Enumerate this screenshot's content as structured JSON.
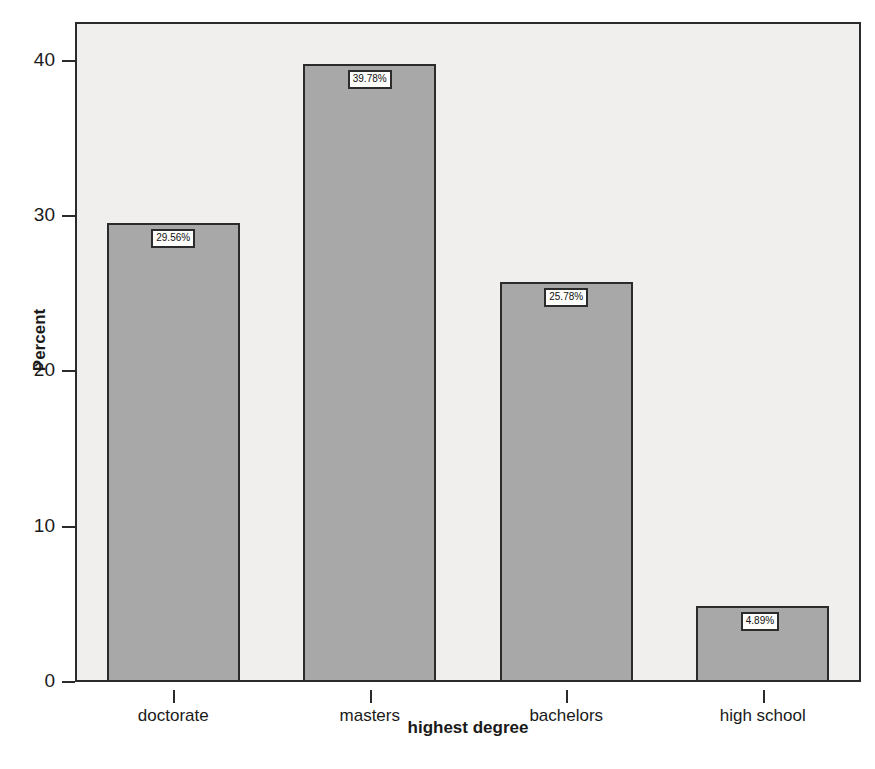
{
  "chart_data": {
    "type": "bar",
    "title": "",
    "xlabel": "highest degree",
    "ylabel": "Percent",
    "categories": [
      "doctorate",
      "masters",
      "bachelors",
      "high school"
    ],
    "values": [
      29.56,
      39.78,
      25.78,
      4.89
    ],
    "data_labels": [
      "29.56%",
      "39.78%",
      "25.78%",
      "4.89%"
    ],
    "ylim": [
      0,
      42.5
    ],
    "yticks": [
      0,
      10,
      20,
      30,
      40
    ],
    "ytick_labels": [
      "0",
      "10",
      "20",
      "30",
      "40"
    ],
    "grid": false,
    "legend": null,
    "bar_color": "#a8a8a8",
    "bar_edge_color": "#2b2b2b",
    "plot_background": "#f0efed",
    "figure_background": "#ffffff"
  },
  "axes": {
    "y_title": "Percent",
    "x_title": "highest degree"
  },
  "caption": {
    "text": ""
  }
}
